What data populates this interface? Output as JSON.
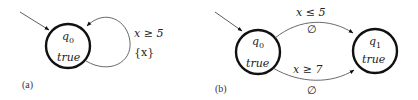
{
  "panel_a": {
    "caption": "(a)",
    "state_q0": {
      "name": "q",
      "subscript": "0",
      "invariant": "true"
    },
    "self_loop": {
      "guard": "x ≥ 5",
      "reset": "{x}"
    }
  },
  "panel_b": {
    "caption": "(b)",
    "state_q0": {
      "name": "q",
      "subscript": "0",
      "invariant": "true"
    },
    "state_q1": {
      "name": "q",
      "subscript": "1",
      "invariant": "true"
    },
    "edge_upper": {
      "guard": "x ≤ 5",
      "reset": "∅"
    },
    "edge_lower": {
      "guard": "x ≥ 7",
      "reset": "∅"
    }
  },
  "colors": {
    "stroke": "#111111",
    "text": "#222222",
    "background": "#ffffff"
  }
}
